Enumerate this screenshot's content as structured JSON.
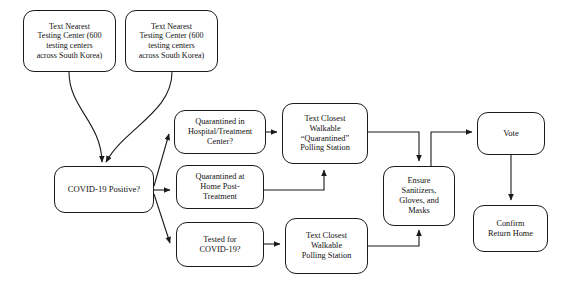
{
  "diagram": {
    "background_color": "#ffffff",
    "stroke_color": "#1b1b1b",
    "text_color": "#111111",
    "nodes": [
      {
        "id": "testing-center-left",
        "label": "Text Nearest\nTesting Center (600\ntesting centers\nacross South Korea)"
      },
      {
        "id": "testing-center-right",
        "label": "Text Nearest\nTesting Center (600\ntesting centers\nacross South Korea)"
      },
      {
        "id": "covid-positive",
        "label": "COVID-19 Positive?"
      },
      {
        "id": "quarantined-hospital",
        "label": "Quarantined in\nHospital/Treatment\nCenter?"
      },
      {
        "id": "quarantined-home",
        "label": "Quarantined at\nHome Post-\nTreatment"
      },
      {
        "id": "tested-for-covid",
        "label": "Tested for\nCOVID-19?"
      },
      {
        "id": "quarantined-polling-station",
        "label": "Text Closest\nWalkable\n“Quarantined”\nPolling Station"
      },
      {
        "id": "polling-station",
        "label": "Text Closest\nWalkable\nPolling Station"
      },
      {
        "id": "ensure-ppe",
        "label": "Ensure\nSanitizers,\nGloves, and\nMasks"
      },
      {
        "id": "vote",
        "label": "Vote"
      },
      {
        "id": "confirm-return-home",
        "label": "Confirm\nReturn Home"
      }
    ],
    "edges": [
      {
        "id": "edge-testing-left-to-covid",
        "from": "testing-center-left",
        "to": "covid-positive",
        "style": "curved",
        "arrow": true
      },
      {
        "id": "edge-testing-right-to-covid",
        "from": "testing-center-right",
        "to": "covid-positive",
        "style": "curved",
        "arrow": true
      },
      {
        "id": "edge-covid-to-hospital",
        "from": "covid-positive",
        "to": "quarantined-hospital",
        "style": "straight",
        "arrow": true
      },
      {
        "id": "edge-covid-to-home",
        "from": "covid-positive",
        "to": "quarantined-home",
        "style": "straight",
        "arrow": true
      },
      {
        "id": "edge-covid-to-tested",
        "from": "covid-positive",
        "to": "tested-for-covid",
        "style": "straight",
        "arrow": true
      },
      {
        "id": "edge-hospital-to-quarantined-polling",
        "from": "quarantined-hospital",
        "to": "quarantined-polling-station",
        "style": "straight",
        "arrow": true
      },
      {
        "id": "edge-home-to-quarantined-polling",
        "from": "quarantined-home",
        "to": "quarantined-polling-station",
        "style": "orthogonal",
        "arrow": true
      },
      {
        "id": "edge-tested-to-polling",
        "from": "tested-for-covid",
        "to": "polling-station",
        "style": "straight",
        "arrow": true
      },
      {
        "id": "edge-quarantined-polling-to-ensure",
        "from": "quarantined-polling-station",
        "to": "ensure-ppe",
        "style": "orthogonal",
        "arrow": true
      },
      {
        "id": "edge-polling-to-ensure",
        "from": "polling-station",
        "to": "ensure-ppe",
        "style": "orthogonal",
        "arrow": true
      },
      {
        "id": "edge-ensure-to-vote",
        "from": "ensure-ppe",
        "to": "vote",
        "style": "orthogonal",
        "arrow": true
      },
      {
        "id": "edge-vote-to-confirm",
        "from": "vote",
        "to": "confirm-return-home",
        "style": "straight",
        "arrow": true
      }
    ]
  }
}
